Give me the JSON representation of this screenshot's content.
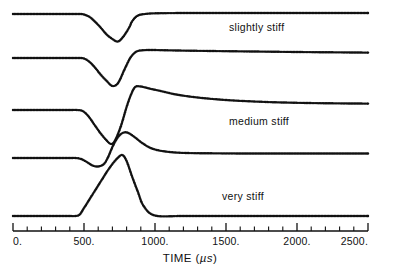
{
  "chart_data": {
    "type": "line",
    "title": "",
    "subtitle": "",
    "xlabel": "TIME (µs)",
    "ylabel": "",
    "xlim": [
      0,
      2500
    ],
    "ylim": [
      0,
      1
    ],
    "grid": false,
    "legend_position": "inline-right",
    "xticks": [
      0,
      500,
      1000,
      1500,
      2000,
      2500
    ],
    "xticklabels": [
      "0.",
      "500.",
      "1000.",
      "1500.",
      "2000.",
      "2500."
    ],
    "xtick_minor_step": 100,
    "marker_style": "open-circle-dotted",
    "annotations": [
      {
        "text": "slightly stiff",
        "x": 1560,
        "y_px": 28
      },
      {
        "text": "medium stiff",
        "x": 1560,
        "y_px": 122
      },
      {
        "text": "very stiff",
        "x": 1500,
        "y_px": 197
      }
    ],
    "series": [
      {
        "name": "trace-1",
        "stiffness_label": "slightly stiff",
        "x": [
          0,
          100,
          200,
          300,
          400,
          470,
          500,
          540,
          580,
          620,
          660,
          700,
          740,
          780,
          820,
          840,
          880,
          940,
          1000,
          1100,
          1250,
          1400,
          1600,
          1800,
          2000,
          2200,
          2500
        ],
        "y_px": [
          14,
          14,
          14,
          14,
          14,
          14,
          14.5,
          17,
          22,
          28,
          34.5,
          39,
          41.5,
          36,
          27,
          21,
          15.5,
          13.8,
          13.3,
          13.1,
          13.0,
          13.0,
          13.0,
          13.0,
          13.0,
          13.0,
          13.0
        ]
      },
      {
        "name": "trace-2",
        "stiffness_label": "",
        "x": [
          0,
          100,
          200,
          300,
          400,
          460,
          500,
          540,
          580,
          620,
          660,
          700,
          740,
          780,
          800,
          830,
          870,
          920,
          980,
          1060,
          1200,
          1400,
          1700,
          2000,
          2250,
          2500
        ],
        "y_px": [
          58,
          58,
          58,
          58,
          58,
          58,
          58.5,
          62,
          68,
          75,
          81,
          86,
          83,
          71,
          65,
          57,
          51.5,
          50.2,
          50.0,
          50.2,
          50.6,
          51.0,
          51.5,
          52.0,
          52.3,
          52.6
        ]
      },
      {
        "name": "trace-3",
        "stiffness_label": "medium stiff",
        "x": [
          0,
          100,
          200,
          300,
          400,
          450,
          490,
          530,
          570,
          610,
          650,
          690,
          720,
          760,
          800,
          830,
          860,
          900,
          960,
          1040,
          1150,
          1300,
          1500,
          1750,
          2000,
          2250,
          2500
        ],
        "y_px": [
          110,
          110,
          110,
          110,
          110,
          110,
          111,
          116,
          124,
          132,
          139,
          144,
          140,
          126,
          107,
          95,
          87,
          86.5,
          88.5,
          91,
          94.5,
          97.5,
          100,
          101.8,
          102.8,
          103.3,
          103.6
        ]
      },
      {
        "name": "trace-4",
        "stiffness_label": "",
        "x": [
          0,
          100,
          200,
          300,
          400,
          440,
          480,
          520,
          560,
          600,
          640,
          670,
          700,
          730,
          760,
          790,
          820,
          860,
          910,
          970,
          1050,
          1180,
          1400,
          1700,
          2000,
          2250,
          2500
        ],
        "y_px": [
          158,
          158,
          158,
          158,
          158,
          158,
          159,
          162,
          165.5,
          166.5,
          164,
          157,
          147,
          139,
          134,
          132.3,
          133.5,
          137.5,
          143,
          148,
          151,
          152.8,
          153.3,
          153.5,
          153.5,
          153.5,
          153.5
        ]
      },
      {
        "name": "trace-5",
        "stiffness_label": "very stiff",
        "x": [
          0,
          100,
          200,
          300,
          400,
          440,
          470,
          500,
          540,
          580,
          620,
          660,
          700,
          740,
          770,
          800,
          840,
          880,
          920,
          1000,
          1200,
          1500,
          1800,
          2100,
          2500
        ],
        "y_px": [
          216,
          216,
          216,
          216,
          216,
          216,
          214.5,
          208,
          199,
          190,
          181,
          172,
          164,
          157.5,
          155,
          161,
          177,
          192,
          206,
          215.5,
          216,
          216,
          216,
          216,
          216
        ]
      }
    ]
  },
  "axis": {
    "label_prefix": "TIME (",
    "unit": "µs",
    "label_suffix": ")"
  },
  "annotations": {
    "slightly_stiff": "slightly stiff",
    "medium_stiff": "medium stiff",
    "very_stiff": "very stiff"
  },
  "ticklabels": {
    "t0": "0.",
    "t500": "500.",
    "t1000": "1000.",
    "t1500": "1500.",
    "t2000": "2000.",
    "t2500": "2500."
  },
  "colors": {
    "ink": "#111111",
    "background": "#ffffff"
  }
}
